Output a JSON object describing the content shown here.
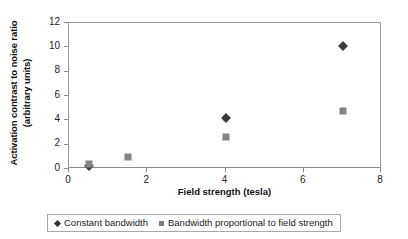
{
  "chart_data": {
    "type": "scatter",
    "title": "",
    "xlabel": "Field strength (tesla)",
    "ylabel": "Activation contrast to noise ratio (arbitrary units)",
    "ylabel_line1": "Activation contrast to noise ratio",
    "ylabel_line2": "(arbitrary units)",
    "xlim": [
      0,
      8
    ],
    "ylim": [
      0,
      12
    ],
    "xticks": [
      0,
      2,
      4,
      6,
      8
    ],
    "yticks": [
      0,
      2,
      4,
      6,
      8,
      10,
      12
    ],
    "xtick_labels": [
      "0",
      "2",
      "4",
      "6",
      "8"
    ],
    "ytick_labels": [
      "0",
      "2",
      "4",
      "6",
      "8",
      "10",
      "12"
    ],
    "grid": false,
    "legend_position": "bottom",
    "series": [
      {
        "name": "Constant bandwidth",
        "marker": "diamond",
        "color": "#3a3a3a",
        "points": [
          {
            "x": 0.5,
            "y": 0.25
          },
          {
            "x": 4.0,
            "y": 4.2
          },
          {
            "x": 7.0,
            "y": 10.1
          }
        ]
      },
      {
        "name": "Bandwidth proportional to field strength",
        "marker": "square",
        "color": "#838383",
        "points": [
          {
            "x": 0.5,
            "y": 0.45
          },
          {
            "x": 1.5,
            "y": 1.0
          },
          {
            "x": 4.0,
            "y": 2.6
          },
          {
            "x": 7.0,
            "y": 4.8
          }
        ]
      }
    ]
  },
  "legend": {
    "entries": [
      {
        "label": "Constant bandwidth",
        "marker": "diamond"
      },
      {
        "label": "Bandwidth proportional to field strength",
        "marker": "square"
      }
    ]
  },
  "colors": {
    "axis": "#8a8a8a",
    "frame": "#9a9a9a",
    "series_constant_bandwidth": "#3a3a3a",
    "series_proportional_bandwidth": "#838383",
    "background": "#ffffff",
    "text": "#1a1a1a"
  }
}
